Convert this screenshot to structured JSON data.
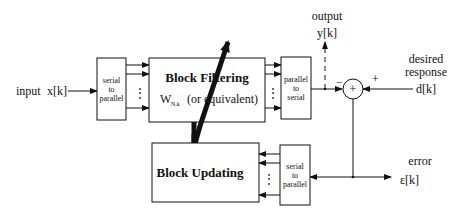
{
  "diagram": {
    "type": "block-diagram",
    "input": {
      "label": "input",
      "signal": "x[k]"
    },
    "output": {
      "label": "output",
      "signal": "y[k]"
    },
    "desired": {
      "label_line1": "desired",
      "label_line2": "response",
      "signal": "d[k]"
    },
    "error": {
      "label": "error",
      "signal": "ε[k]"
    },
    "blocks": {
      "s2p_in": {
        "line1": "serial",
        "line2": "to",
        "line3": "parallel"
      },
      "filter": {
        "title": "Block Filtering",
        "weight_main": "W",
        "weight_sub": "N,k",
        "weight_note": "(or equivalent)"
      },
      "p2s": {
        "line1": "parallel",
        "line2": "to",
        "line3": "serial"
      },
      "update": {
        "title": "Block Updating"
      },
      "s2p_err": {
        "line1": "serial",
        "line2": "to",
        "line3": "parallel"
      }
    },
    "summer": {
      "symbol": "+",
      "minus_sign": "−",
      "plus_sign": "+"
    },
    "dots": "⋮"
  }
}
